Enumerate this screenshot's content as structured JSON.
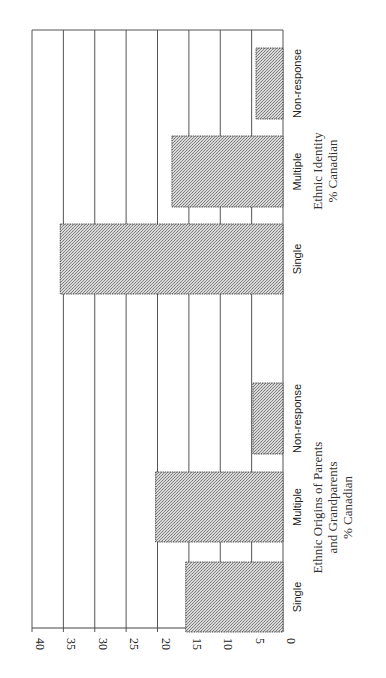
{
  "chart_data": {
    "type": "bar",
    "orientation": "rotated 90 degrees (value axis runs horizontally along bottom, bars extend from right baseline leftward)",
    "title": "",
    "ylabel": "%",
    "ylim": [
      0,
      40
    ],
    "yticks": [
      "0",
      "5",
      "10",
      "15",
      "20",
      "25",
      "30",
      "35",
      "40"
    ],
    "grid": true,
    "groups": [
      {
        "name": "Ethnic Origins of Parents and Grandparents",
        "label_lines": [
          "Ethnic Origins of Parents",
          "and Grandparents",
          "% Canadian"
        ],
        "categories": [
          "Single",
          "Multiple",
          "Non-response"
        ],
        "values": [
          15.5,
          20.3,
          4.8
        ]
      },
      {
        "name": "Ethnic Identity",
        "label_lines": [
          "Ethnic Identity",
          "% Canadian"
        ],
        "categories": [
          "Single",
          "Multiple",
          "Non-response"
        ],
        "values": [
          35.5,
          17.7,
          4.3
        ]
      }
    ],
    "bar_fill": "#bdbdbd",
    "bar_pattern": "fine crosshatch stipple",
    "legend": "none"
  }
}
